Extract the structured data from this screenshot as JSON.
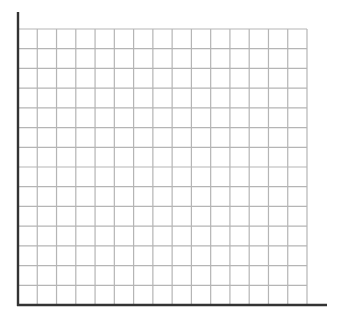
{
  "diagram": {
    "type": "blank-grid",
    "columns": 15,
    "rows": 14,
    "grid": {
      "left": 18,
      "top": 29,
      "right": 307,
      "bottom": 305,
      "line_color": "#b5b5b5",
      "line_width": 1.2
    },
    "y_axis": {
      "x": 18,
      "top": 12,
      "bottom": 306,
      "color": "#333333",
      "width": 2.4
    },
    "x_axis": {
      "y": 305,
      "left": 17,
      "right": 327,
      "color": "#333333",
      "width": 2.4
    },
    "labels": []
  }
}
